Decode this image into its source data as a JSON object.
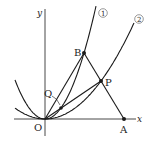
{
  "diagram": {
    "type": "coordinate-geometry",
    "axes": {
      "x_label": "x",
      "y_label": "y",
      "origin_label": "O"
    },
    "curves": [
      {
        "id": "curve-1",
        "label": "①",
        "description": "steeper parabola through O and B"
      },
      {
        "id": "curve-2",
        "label": "②",
        "description": "wider parabola through O and P"
      }
    ],
    "points": [
      {
        "label": "O",
        "on": "origin"
      },
      {
        "label": "A",
        "on": "x-axis"
      },
      {
        "label": "B",
        "on": "curve ①"
      },
      {
        "label": "P",
        "on": "curve ② and segment AB"
      },
      {
        "label": "Q",
        "on": "curve ① and segment OP"
      }
    ],
    "segments": [
      "OB",
      "BA",
      "OP"
    ],
    "colors": {
      "stroke": "#1a1a1a",
      "background": "#ffffff"
    }
  }
}
